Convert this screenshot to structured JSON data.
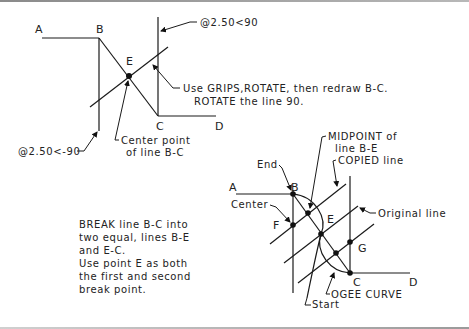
{
  "figure_top": {
    "points": {
      "A": "A",
      "B": "B",
      "C": "C",
      "D": "D",
      "E": "E"
    },
    "annotations": {
      "polar_up": "@2.50<90",
      "polar_down": "@2.50<-90",
      "grips_line1": "Use GRIPS,ROTATE, then redraw B-C.",
      "grips_line2": "ROTATE the line 90.",
      "center_line1": "Center point",
      "center_line2": "of line B-C"
    }
  },
  "instructions": {
    "lines": [
      "BREAK line B-C into",
      "two equal, lines B-E",
      "and E-C.",
      "Use point E as both",
      "the first and second",
      "break point."
    ]
  },
  "figure_bottom": {
    "points": {
      "A": "A",
      "B": "B",
      "C": "C",
      "D": "D",
      "E": "E",
      "F": "F",
      "G": "G"
    },
    "annotations": {
      "end": "End",
      "center": "Center",
      "midpoint_line1": "MIDPOINT of",
      "midpoint_line2": "line B-E",
      "copied_line": "COPIED line",
      "original_line": "Original line",
      "ogee_curve": "OGEE CURVE",
      "start": "Start"
    }
  }
}
